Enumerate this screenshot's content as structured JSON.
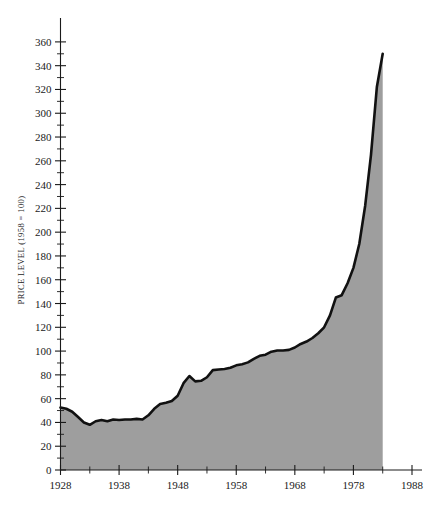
{
  "chart_data": {
    "type": "area",
    "title": "",
    "subtitle": "",
    "xlabel": "",
    "ylabel": "PRICE LEVEL (1958 = 100)",
    "grid": false,
    "legend": false,
    "legend_position": "none",
    "xlim": [
      1928,
      1988
    ],
    "ylim": [
      0,
      370
    ],
    "y_tick_step": 20,
    "y_minor_step": 10,
    "x_tick_step": 10,
    "x_minor_step": 5,
    "x_ticks": [
      1928,
      1938,
      1948,
      1958,
      1968,
      1978,
      1988
    ],
    "x_tick_labels": [
      "1928",
      "1938",
      "1948",
      "1958",
      "1968",
      "1978",
      "1988"
    ],
    "x_minor_ticks": [
      1933,
      1943,
      1953,
      1963,
      1973,
      1983
    ],
    "y_ticks": [
      0,
      20,
      40,
      60,
      80,
      100,
      120,
      140,
      160,
      180,
      200,
      220,
      240,
      260,
      280,
      300,
      320,
      340,
      360
    ],
    "y_tick_labels": [
      "0",
      "20",
      "40",
      "60",
      "80",
      "100",
      "120",
      "140",
      "160",
      "180",
      "200",
      "220",
      "240",
      "260",
      "280",
      "300",
      "320",
      "340",
      "360"
    ],
    "series": [
      {
        "name": "Price level",
        "fill_color": "#9e9e9e",
        "line_color": "#111111",
        "line_width": 2.6,
        "x": [
          1928,
          1929,
          1930,
          1931,
          1932,
          1933,
          1934,
          1935,
          1936,
          1937,
          1938,
          1939,
          1940,
          1941,
          1942,
          1943,
          1944,
          1945,
          1946,
          1947,
          1948,
          1949,
          1950,
          1951,
          1952,
          1953,
          1954,
          1955,
          1956,
          1957,
          1958,
          1959,
          1960,
          1961,
          1962,
          1963,
          1964,
          1965,
          1966,
          1967,
          1968,
          1969,
          1970,
          1971,
          1972,
          1973,
          1974,
          1975,
          1976,
          1977,
          1978,
          1979,
          1980,
          1981,
          1982,
          1983
        ],
        "values": [
          52.5,
          51.5,
          49.0,
          44.5,
          40.0,
          38.0,
          41.0,
          42.0,
          41.0,
          42.5,
          42.0,
          42.5,
          42.5,
          43.0,
          42.5,
          46.0,
          51.5,
          55.5,
          56.5,
          58.0,
          62.5,
          73.0,
          79.0,
          74.5,
          75.0,
          78.0,
          84.0,
          84.5,
          85.0,
          86.0,
          88.0,
          89.0,
          90.5,
          93.5,
          96.0,
          97.0,
          99.5,
          100.5,
          100.5,
          101.0,
          103.0,
          106.0,
          108.0,
          111.0,
          115.0,
          120.0,
          130.0,
          145.0,
          147.0,
          157.0,
          170.0,
          190.0,
          222.0,
          265.0,
          322.0,
          350.0
        ]
      }
    ],
    "annotations": []
  }
}
